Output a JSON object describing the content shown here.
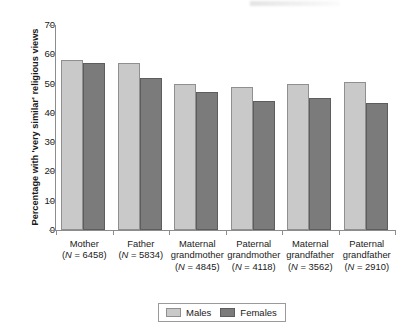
{
  "chart_data": {
    "type": "bar",
    "title": "",
    "xlabel": "",
    "ylabel": "Percentage with 'very similar' religious views",
    "ylim": [
      0,
      70
    ],
    "yticks": [
      0,
      10,
      20,
      30,
      40,
      50,
      60,
      70
    ],
    "grid": false,
    "legend_position": "bottom-center",
    "categories": [
      "Mother",
      "Father",
      "Maternal grandmother",
      "Paternal grandmother",
      "Maternal grandfather",
      "Paternal grandfather"
    ],
    "category_lines": [
      [
        "Mother",
        "(N = 6458)"
      ],
      [
        "Father",
        "(N = 5834)"
      ],
      [
        "Maternal",
        "grandmother",
        "(N = 4845)"
      ],
      [
        "Paternal",
        "grandmother",
        "(N = 4118)"
      ],
      [
        "Maternal",
        "grandfather",
        "(N = 3562)"
      ],
      [
        "Paternal",
        "grandfather",
        "(N = 2910)"
      ]
    ],
    "sample_sizes": [
      6458,
      5834,
      4845,
      4118,
      3562,
      2910
    ],
    "series": [
      {
        "name": "Males",
        "color": "#c9c9c9",
        "values": [
          58,
          57,
          50,
          49,
          50,
          50.5
        ]
      },
      {
        "name": "Females",
        "color": "#7b7b7b",
        "values": [
          57,
          52,
          47,
          44,
          45,
          43.5
        ]
      }
    ]
  },
  "axis": {
    "y_title": "Percentage with 'very similar' religious views",
    "tick_labels": [
      "0",
      "10",
      "20",
      "30",
      "40",
      "50",
      "60",
      "70"
    ]
  },
  "legend": {
    "items": [
      {
        "label": "Males",
        "swatch": "males"
      },
      {
        "label": "Females",
        "swatch": "females"
      }
    ]
  }
}
